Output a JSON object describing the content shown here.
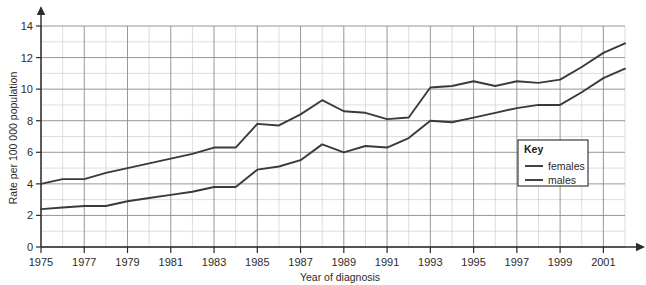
{
  "chart_data": {
    "type": "line",
    "title": "",
    "xlabel": "Year of diagnosis",
    "ylabel": "Rate per 100 000 population",
    "xlim": [
      1975,
      2002
    ],
    "ylim": [
      0,
      14
    ],
    "yticks": [
      0,
      2,
      4,
      6,
      8,
      10,
      12,
      14
    ],
    "ytick_labels": [
      "0",
      "2",
      "4",
      "6",
      "8",
      "10",
      "12",
      "14"
    ],
    "xticks": [
      1975,
      1977,
      1979,
      1981,
      1983,
      1985,
      1987,
      1989,
      1991,
      1993,
      1995,
      1997,
      1999,
      2001
    ],
    "xtick_labels": [
      "1975",
      "1977",
      "1979",
      "1981",
      "1983",
      "1985",
      "1987",
      "1989",
      "1991",
      "1993",
      "1995",
      "1997",
      "1999",
      "2001"
    ],
    "grid": true,
    "grid_major_y_step": 2,
    "grid_minor_y_step": 1,
    "grid_major_x_step": 2,
    "grid_minor_x_step": 1,
    "legend_position": "inside-lower-right",
    "legend_title": "Key",
    "x": [
      1975,
      1976,
      1977,
      1978,
      1979,
      1980,
      1981,
      1982,
      1983,
      1984,
      1985,
      1986,
      1987,
      1988,
      1989,
      1990,
      1991,
      1992,
      1993,
      1994,
      1995,
      1996,
      1997,
      1998,
      1999,
      2000,
      2001,
      2002
    ],
    "series": [
      {
        "name": "females",
        "color": "#3a3a3a",
        "values": [
          4.0,
          4.3,
          4.3,
          4.7,
          5.0,
          5.3,
          5.6,
          5.9,
          6.3,
          6.3,
          7.8,
          7.7,
          8.4,
          9.3,
          8.6,
          8.5,
          8.1,
          8.2,
          10.1,
          10.2,
          10.5,
          10.2,
          10.5,
          10.4,
          10.6,
          11.4,
          12.3,
          12.9
        ]
      },
      {
        "name": "males",
        "color": "#3a3a3a",
        "values": [
          2.4,
          2.5,
          2.6,
          2.6,
          2.9,
          3.1,
          3.3,
          3.5,
          3.8,
          3.8,
          4.9,
          5.1,
          5.5,
          6.5,
          6.0,
          6.4,
          6.3,
          6.9,
          8.0,
          7.9,
          8.2,
          8.5,
          8.8,
          9.0,
          9.0,
          9.8,
          10.7,
          11.3
        ]
      }
    ]
  },
  "legend": {
    "title": "Key",
    "entries": [
      {
        "label": "females"
      },
      {
        "label": "males"
      }
    ]
  },
  "colors": {
    "background": "#ffffff",
    "axis": "#2b2b2b",
    "grid_major": "#8b8b8b",
    "grid_minor": "#cfcfcf",
    "line": "#3a3a3a",
    "legend_border": "#2b2b2b"
  }
}
